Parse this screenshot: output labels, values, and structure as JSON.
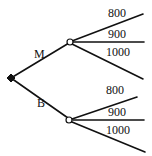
{
  "diagram": {
    "type": "decision-tree",
    "root": {
      "id": "root",
      "shape": "filled-diamond"
    },
    "branches": [
      {
        "label": "M",
        "node_shape": "open-circle",
        "outcomes": [
          {
            "label": "800"
          },
          {
            "label": "900"
          },
          {
            "label": "1000"
          }
        ]
      },
      {
        "label": "B",
        "node_shape": "open-circle",
        "outcomes": [
          {
            "label": "800"
          },
          {
            "label": "900"
          },
          {
            "label": "1000"
          }
        ]
      }
    ]
  }
}
